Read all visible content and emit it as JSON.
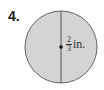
{
  "problem": {
    "number": "4.",
    "figure": {
      "shape": "circle",
      "fill_color": "#d4d4d4",
      "stroke_color": "#555555",
      "segment": "diameter",
      "label": {
        "numerator": "2",
        "denominator": "3",
        "unit": "in."
      }
    }
  }
}
